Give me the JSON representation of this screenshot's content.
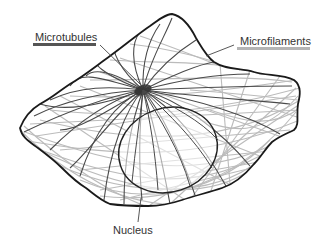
{
  "diagram": {
    "type": "cell-cytoskeleton-illustration",
    "labels": {
      "microtubules": "Microtubules",
      "microfilaments": "Microfilaments",
      "nucleus": "Nucleus"
    },
    "legend": [
      {
        "name": "Microtubules",
        "color": "#555555",
        "style": "dark thick bar"
      },
      {
        "name": "Microfilaments",
        "color": "#b4b4b4",
        "style": "light gray bar"
      }
    ],
    "colors": {
      "background": "#ffffff",
      "cell_outline": "#1a1a1a",
      "microtubule": "#4a4a4a",
      "microfilament": "#b8b8b8",
      "nucleus_outline": "#222222",
      "label_text": "#333333",
      "leader_line": "#444444"
    }
  }
}
